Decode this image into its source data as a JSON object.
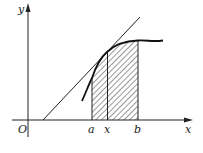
{
  "diagram": {
    "type": "area-under-curve",
    "axis_labels": {
      "x": "x",
      "y": "y",
      "origin": "O"
    },
    "tick_labels": [
      {
        "name": "a",
        "text": "a"
      },
      {
        "name": "x",
        "text": "x"
      },
      {
        "name": "b",
        "text": "b"
      }
    ],
    "elements": [
      "x-axis",
      "y-axis",
      "curve",
      "tangent-line",
      "hatched-region-a-to-b",
      "vertical-line-at-x"
    ],
    "colors": {
      "stroke": "#222222",
      "background": "#ffffff"
    }
  }
}
